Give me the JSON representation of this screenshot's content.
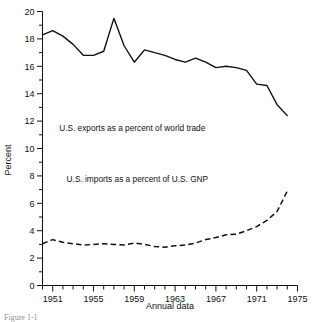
{
  "figure": {
    "caption_partial": "Figure 1-1",
    "ylabel": "Percent",
    "xlabel": "Annual data"
  },
  "annotations": {
    "exports_label": "U.S. exports as a percent of world trade",
    "imports_label": "U.S. imports as a percent of U.S. GNP"
  },
  "colors": {
    "ink": "#111111",
    "background": "#ffffff"
  },
  "chart_data": {
    "type": "line",
    "title": "",
    "xlabel": "Annual data",
    "ylabel": "Percent",
    "xlim": [
      1950,
      1975
    ],
    "ylim": [
      0,
      20
    ],
    "ytick_labels": [
      "0",
      "2",
      "4",
      "6",
      "8",
      "10",
      "12",
      "14",
      "16",
      "18",
      "20"
    ],
    "ytick_values": [
      0,
      2,
      4,
      6,
      8,
      10,
      12,
      14,
      16,
      18,
      20
    ],
    "yminor_step": 1,
    "xtick_labels": [
      "1951",
      "1955",
      "1959",
      "1963",
      "1967",
      "1971",
      "1975"
    ],
    "xtick_values": [
      1951,
      1955,
      1959,
      1963,
      1967,
      1971,
      1975
    ],
    "xminor_step": 1,
    "grid": false,
    "legend_position": "inline-annotation",
    "x": [
      1950,
      1951,
      1952,
      1953,
      1954,
      1955,
      1956,
      1957,
      1958,
      1959,
      1960,
      1961,
      1962,
      1963,
      1964,
      1965,
      1966,
      1967,
      1968,
      1969,
      1970,
      1971,
      1972,
      1973,
      1974
    ],
    "series": [
      {
        "name": "U.S. exports as a percent of world trade",
        "style": "solid",
        "values": [
          18.3,
          18.6,
          18.2,
          17.6,
          16.8,
          16.8,
          17.1,
          19.5,
          17.5,
          16.3,
          17.2,
          17.0,
          16.8,
          16.5,
          16.3,
          16.6,
          16.3,
          15.9,
          16.0,
          15.9,
          15.7,
          14.7,
          14.6,
          13.2,
          12.4
        ],
        "label_x_data": 1958.8,
        "label_y_data": 11.3
      },
      {
        "name": "U.S. imports as a percent of U.S. GNP",
        "style": "dashed",
        "values": [
          3.05,
          3.35,
          3.15,
          3.05,
          2.95,
          3.0,
          3.05,
          3.0,
          2.95,
          3.1,
          3.0,
          2.85,
          2.8,
          2.9,
          2.95,
          3.1,
          3.35,
          3.5,
          3.7,
          3.75,
          4.0,
          4.3,
          4.75,
          5.4,
          6.9
        ],
        "label_x_data": 1959.3,
        "label_y_data": 7.55
      }
    ]
  }
}
